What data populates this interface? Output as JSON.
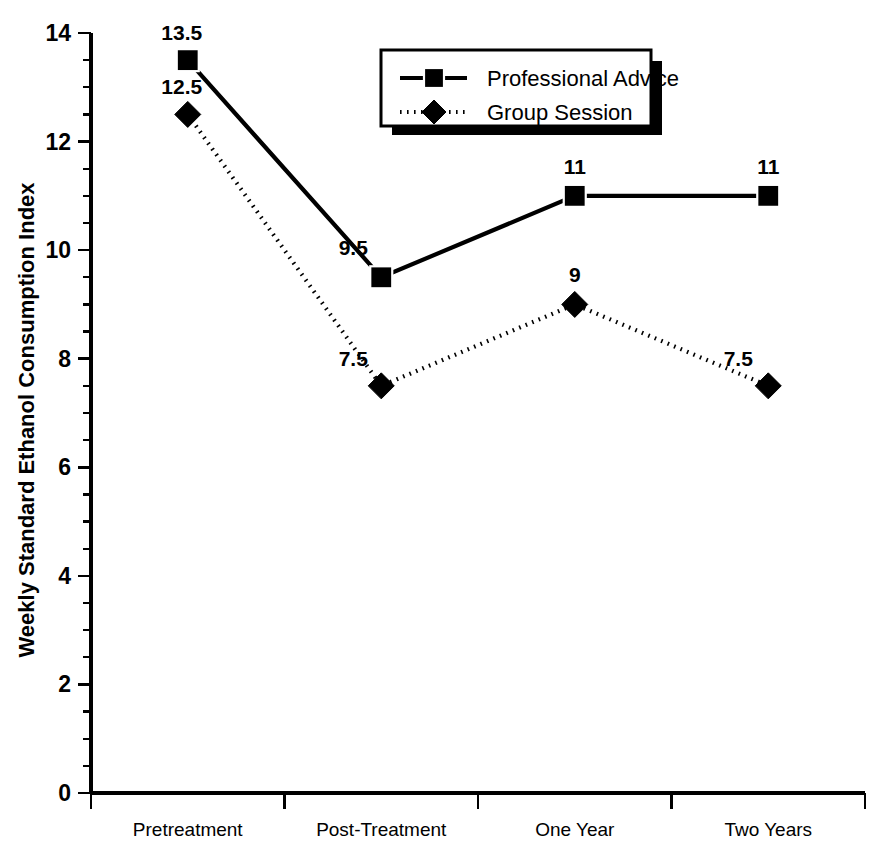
{
  "chart_data": {
    "type": "line",
    "title": "",
    "xlabel": "",
    "ylabel": "Weekly Standard Ethanol Consumption Index",
    "categories": [
      "Pretreatment",
      "Post-Treatment",
      "One Year",
      "Two Years"
    ],
    "ylim": [
      0,
      14
    ],
    "y_ticks": [
      "0",
      "2",
      "4",
      "6",
      "8",
      "10",
      "12",
      "14"
    ],
    "y_tick_values": [
      0,
      2,
      4,
      6,
      8,
      10,
      12,
      14
    ],
    "y_minor_step": 0.5,
    "grid": false,
    "legend_position": "top-center-right",
    "series": [
      {
        "name": "Professional Advice",
        "marker": "square",
        "line_style": "solid",
        "color": "#000000",
        "values": [
          13.5,
          9.5,
          11,
          11
        ],
        "labels": [
          "13.5",
          "9.5",
          "11",
          "11"
        ]
      },
      {
        "name": "Group Session",
        "marker": "diamond",
        "line_style": "dotted",
        "color": "#000000",
        "values": [
          12.5,
          7.5,
          9,
          7.5
        ],
        "labels": [
          "12.5",
          "7.5",
          "9",
          "7.5"
        ]
      }
    ]
  },
  "legend": {
    "entries": [
      {
        "label": "Professional Advice",
        "marker": "square-marker",
        "line": "solid-line-sample"
      },
      {
        "label": "Group Session",
        "marker": "diamond-marker",
        "line": "dotted-line-sample"
      }
    ]
  }
}
